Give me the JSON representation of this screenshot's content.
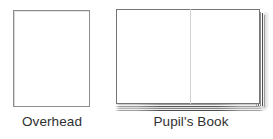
{
  "figures": [
    {
      "id": "overhead",
      "caption": "Overhead",
      "icon": "transparency-sheet-icon",
      "shape": "rectangle",
      "border_color": "#8d8d8d",
      "fill_color": "#ffffff"
    },
    {
      "id": "pupils-book",
      "caption": "Pupil's Book",
      "icon": "open-book-icon",
      "shape": "open-book",
      "border_color": "#757575",
      "fill_color": "#ffffff",
      "spine_color": "#d2d2d2",
      "page_edge_color": "#4d4d4d"
    }
  ],
  "canvas": {
    "background": "#ffffff",
    "text_color": "#2f2f2f"
  }
}
